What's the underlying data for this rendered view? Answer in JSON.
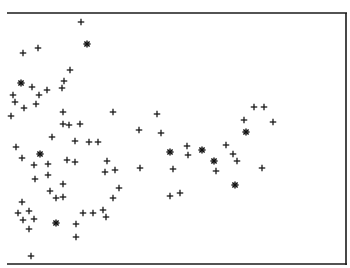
{
  "chart_data": {
    "type": "scatter",
    "title": "",
    "xlabel": "",
    "ylabel": "",
    "grid": false,
    "legend": null,
    "frame": {
      "top": true,
      "right": true,
      "bottom": true,
      "left": false
    },
    "ink_color": "#1a1a1a",
    "background": "#ffffff",
    "pixel_extent": {
      "x": [
        7,
        346
      ],
      "y": [
        13,
        264
      ]
    },
    "series": [
      {
        "name": "plus",
        "marker": "+",
        "points": [
          [
            81,
            22
          ],
          [
            23,
            53
          ],
          [
            38,
            48
          ],
          [
            70,
            70
          ],
          [
            32,
            87
          ],
          [
            64,
            81
          ],
          [
            62,
            88
          ],
          [
            47,
            90
          ],
          [
            13,
            95
          ],
          [
            39,
            95
          ],
          [
            15,
            102
          ],
          [
            24,
            108
          ],
          [
            36,
            104
          ],
          [
            11,
            116
          ],
          [
            63,
            112
          ],
          [
            63,
            124
          ],
          [
            69,
            125
          ],
          [
            80,
            124
          ],
          [
            113,
            112
          ],
          [
            52,
            137
          ],
          [
            75,
            141
          ],
          [
            89,
            142
          ],
          [
            98,
            142
          ],
          [
            16,
            147
          ],
          [
            22,
            158
          ],
          [
            34,
            165
          ],
          [
            48,
            164
          ],
          [
            67,
            160
          ],
          [
            75,
            162
          ],
          [
            35,
            179
          ],
          [
            48,
            175
          ],
          [
            50,
            191
          ],
          [
            63,
            184
          ],
          [
            107,
            161
          ],
          [
            105,
            172
          ],
          [
            115,
            170
          ],
          [
            119,
            188
          ],
          [
            113,
            198
          ],
          [
            22,
            202
          ],
          [
            18,
            213
          ],
          [
            29,
            211
          ],
          [
            23,
            220
          ],
          [
            34,
            219
          ],
          [
            56,
            198
          ],
          [
            63,
            197
          ],
          [
            29,
            229
          ],
          [
            76,
            224
          ],
          [
            76,
            237
          ],
          [
            83,
            213
          ],
          [
            93,
            213
          ],
          [
            103,
            210
          ],
          [
            106,
            217
          ],
          [
            31,
            256
          ],
          [
            157,
            114
          ],
          [
            139,
            130
          ],
          [
            161,
            133
          ],
          [
            187,
            146
          ],
          [
            188,
            155
          ],
          [
            216,
            171
          ],
          [
            226,
            145
          ],
          [
            233,
            154
          ],
          [
            237,
            161
          ],
          [
            140,
            168
          ],
          [
            173,
            169
          ],
          [
            170,
            196
          ],
          [
            180,
            193
          ],
          [
            254,
            107
          ],
          [
            264,
            107
          ],
          [
            244,
            120
          ],
          [
            273,
            122
          ],
          [
            262,
            168
          ]
        ]
      },
      {
        "name": "asterisk",
        "marker": "*",
        "points": [
          [
            87,
            44
          ],
          [
            21,
            83
          ],
          [
            40,
            154
          ],
          [
            56,
            223
          ],
          [
            170,
            152
          ],
          [
            202,
            150
          ],
          [
            214,
            161
          ],
          [
            246,
            132
          ],
          [
            235,
            185
          ]
        ]
      }
    ]
  }
}
